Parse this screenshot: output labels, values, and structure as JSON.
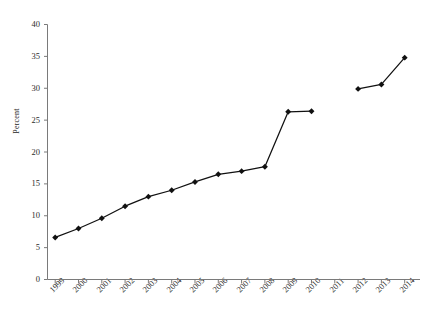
{
  "title_clipped": "",
  "axis": {
    "ylabel": "Percent",
    "xlabel": "",
    "ymin": 0,
    "ymax": 40,
    "ystep": 5,
    "yticks": [
      "0",
      "5",
      "10",
      "15",
      "20",
      "25",
      "30",
      "35",
      "40"
    ]
  },
  "style": {
    "line_color": "#111111",
    "marker_color": "#111111",
    "axis_color": "#7a7a7a",
    "background": "#ffffff"
  },
  "chart_data": {
    "type": "line",
    "title": "",
    "subtitle": "",
    "xlabel": "",
    "ylabel": "Percent",
    "ylim": [
      0,
      40
    ],
    "grid": false,
    "legend": "none",
    "categories": [
      "1999",
      "2000",
      "2001",
      "2002",
      "2003",
      "2004",
      "2005",
      "2006",
      "2007",
      "2008",
      "2009",
      "2010",
      "2011",
      "2012",
      "2013",
      "2014"
    ],
    "values": [
      6.6,
      8.0,
      9.6,
      11.5,
      13.0,
      14.0,
      15.3,
      16.5,
      17.0,
      17.7,
      26.3,
      26.4,
      null,
      29.9,
      30.6,
      34.8
    ],
    "series": [
      {
        "name": "Percent",
        "values": [
          6.6,
          8.0,
          9.6,
          11.5,
          13.0,
          14.0,
          15.3,
          16.5,
          17.0,
          17.7,
          26.3,
          26.4,
          null,
          29.9,
          30.6,
          34.8
        ]
      }
    ],
    "missing_categories": [
      "2011"
    ],
    "annotations": []
  }
}
